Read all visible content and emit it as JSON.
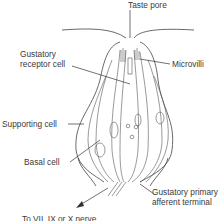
{
  "diagram": {
    "labels": {
      "taste_pore": "Taste pore",
      "gustatory_receptor_cell_line1": "Gustatory",
      "gustatory_receptor_cell_line2": "receptor cell",
      "microvilli": "Microvilli",
      "supporting_cell": "Supporting cell",
      "basal_cell": "Basal cell",
      "afferent_line1": "Gustatory primary",
      "afferent_line2": "afferent terminal",
      "nerve": "To VII, IX or X nerve"
    },
    "colors": {
      "stroke": "#444444",
      "text": "#3a3a3a",
      "background": "#ffffff"
    }
  }
}
